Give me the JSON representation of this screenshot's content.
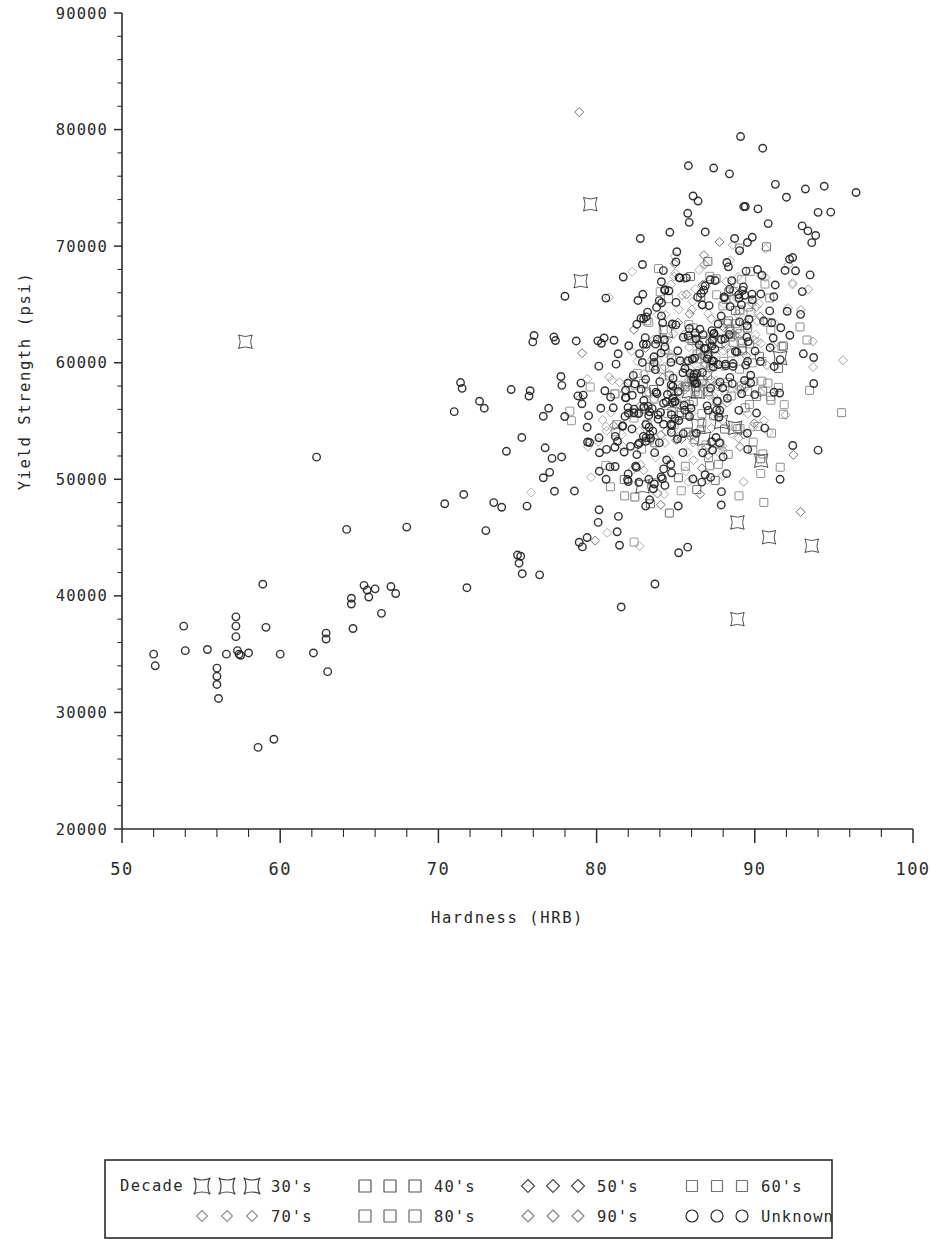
{
  "figure": {
    "width": 931,
    "height": 1239,
    "background": "#ffffff",
    "ink": "#2b2b2b"
  },
  "plot_area": {
    "left": 122,
    "right": 913,
    "top": 13,
    "bottom": 829
  },
  "chart_data": {
    "type": "scatter",
    "title": "",
    "xlabel": "Hardness (HRB)",
    "ylabel": "Yield Strength (psi)",
    "xlim": [
      50,
      100
    ],
    "ylim": [
      20000,
      90000
    ],
    "xticks": [
      50,
      60,
      70,
      80,
      90,
      100
    ],
    "xtick_labels": [
      "50",
      "60",
      "70",
      "80",
      "90",
      "100"
    ],
    "yticks": [
      20000,
      30000,
      40000,
      50000,
      60000,
      70000,
      80000,
      90000
    ],
    "ytick_labels": [
      "20000",
      "30000",
      "40000",
      "50000",
      "60000",
      "70000",
      "80000",
      "90000"
    ],
    "x_minor_step": 2,
    "y_minor_step": 2000,
    "grid": false,
    "legend_position": "below-outside",
    "legend_title": "Decade",
    "series": [
      {
        "name": "30's",
        "marker": "cushion-square",
        "size": 13,
        "color": "#3a3a3a",
        "opacity": 0.85,
        "stroke_width": 1.0,
        "count": 18,
        "cluster": {
          "x_mean": 88.0,
          "x_sd": 3.4,
          "y_mean": 52000,
          "y_sd": 8200,
          "corr": 0.25
        },
        "explicit_points": [
          [
            57.8,
            61800
          ],
          [
            79.6,
            73600
          ],
          [
            88.9,
            38000
          ],
          [
            88.9,
            46300
          ],
          [
            90.4,
            51600
          ],
          [
            93.6,
            44300
          ],
          [
            82.9,
            49400
          ],
          [
            86.4,
            57500
          ],
          [
            91.6,
            60400
          ],
          [
            84.4,
            62700
          ],
          [
            79.0,
            67000
          ]
        ]
      },
      {
        "name": "40's",
        "marker": "square",
        "size": 8,
        "color": "#4a4a4a",
        "opacity": 0.8,
        "stroke_width": 1.0,
        "count": 36,
        "cluster": {
          "x_mean": 86.2,
          "x_sd": 3.0,
          "y_mean": 57500,
          "y_sd": 5600,
          "corr": 0.35
        },
        "explicit_points": [
          [
            83.4,
            47900
          ],
          [
            84.6,
            47100
          ],
          [
            91.5,
            59500
          ]
        ]
      },
      {
        "name": "50's",
        "marker": "diamond",
        "size": 9,
        "color": "#505050",
        "opacity": 0.8,
        "stroke_width": 1.0,
        "count": 52,
        "cluster": {
          "x_mean": 85.6,
          "x_sd": 3.1,
          "y_mean": 59000,
          "y_sd": 5400,
          "corr": 0.38
        },
        "explicit_points": [
          [
            78.9,
            81500
          ],
          [
            92.9,
            47200
          ]
        ]
      },
      {
        "name": "60's",
        "marker": "square",
        "size": 8,
        "color": "#6a6a6a",
        "opacity": 0.7,
        "stroke_width": 1.0,
        "count": 58,
        "cluster": {
          "x_mean": 87.2,
          "x_sd": 3.2,
          "y_mean": 58500,
          "y_sd": 5200,
          "corr": 0.33
        },
        "explicit_points": []
      },
      {
        "name": "70's",
        "marker": "diamond",
        "size": 9,
        "color": "#7d7d7d",
        "opacity": 0.72,
        "stroke_width": 1.0,
        "count": 86,
        "cluster": {
          "x_mean": 86.8,
          "x_sd": 3.3,
          "y_mean": 58800,
          "y_sd": 5300,
          "corr": 0.36
        },
        "explicit_points": []
      },
      {
        "name": "80's",
        "marker": "square",
        "size": 8,
        "color": "#5e5e5e",
        "opacity": 0.72,
        "stroke_width": 1.0,
        "count": 78,
        "cluster": {
          "x_mean": 87.4,
          "x_sd": 3.0,
          "y_mean": 58200,
          "y_sd": 5000,
          "corr": 0.34
        },
        "explicit_points": []
      },
      {
        "name": "90's",
        "marker": "diamond",
        "size": 9,
        "color": "#8a8a8a",
        "opacity": 0.68,
        "stroke_width": 1.0,
        "count": 96,
        "cluster": {
          "x_mean": 86.0,
          "x_sd": 3.2,
          "y_mean": 58600,
          "y_sd": 5100,
          "corr": 0.37
        },
        "explicit_points": []
      },
      {
        "name": "Unknown",
        "marker": "circle",
        "size": 7.5,
        "color": "#222222",
        "opacity": 0.92,
        "stroke_width": 1.4,
        "count": 430,
        "cluster": {
          "x_mean": 85.4,
          "x_sd": 3.6,
          "y_mean": 59500,
          "y_sd": 6200,
          "corr": 0.42
        },
        "explicit_points": [
          [
            52.0,
            35000
          ],
          [
            52.1,
            34000
          ],
          [
            53.9,
            37400
          ],
          [
            54.0,
            35300
          ],
          [
            55.4,
            35400
          ],
          [
            56.0,
            33800
          ],
          [
            56.0,
            33100
          ],
          [
            56.0,
            32400
          ],
          [
            56.1,
            31200
          ],
          [
            56.6,
            35000
          ],
          [
            57.2,
            38200
          ],
          [
            57.2,
            37400
          ],
          [
            57.2,
            36500
          ],
          [
            57.3,
            35300
          ],
          [
            57.4,
            35000
          ],
          [
            57.5,
            34900
          ],
          [
            58.0,
            35100
          ],
          [
            58.6,
            27000
          ],
          [
            58.9,
            41000
          ],
          [
            59.1,
            37300
          ],
          [
            59.6,
            27700
          ],
          [
            60.0,
            35000
          ],
          [
            62.1,
            35100
          ],
          [
            62.3,
            51900
          ],
          [
            62.9,
            36800
          ],
          [
            62.9,
            36300
          ],
          [
            63.0,
            33500
          ],
          [
            64.2,
            45700
          ],
          [
            64.5,
            39800
          ],
          [
            64.5,
            39300
          ],
          [
            64.6,
            37200
          ],
          [
            65.3,
            40900
          ],
          [
            65.5,
            40500
          ],
          [
            65.6,
            39900
          ],
          [
            66.0,
            40600
          ],
          [
            66.4,
            38500
          ],
          [
            67.0,
            40800
          ],
          [
            67.3,
            40200
          ],
          [
            68.0,
            45900
          ],
          [
            70.4,
            47900
          ],
          [
            71.0,
            55800
          ],
          [
            71.4,
            58300
          ],
          [
            71.5,
            57800
          ],
          [
            71.6,
            48700
          ],
          [
            71.8,
            40700
          ],
          [
            72.6,
            56700
          ],
          [
            72.9,
            56100
          ],
          [
            73.0,
            45600
          ],
          [
            73.5,
            48000
          ],
          [
            74.0,
            47600
          ],
          [
            74.3,
            52400
          ],
          [
            74.6,
            57700
          ],
          [
            75.0,
            43500
          ],
          [
            75.1,
            42800
          ],
          [
            75.2,
            43400
          ],
          [
            75.3,
            41900
          ],
          [
            75.6,
            47700
          ],
          [
            75.8,
            57600
          ],
          [
            76.4,
            41800
          ],
          [
            77.3,
            62200
          ],
          [
            77.4,
            61900
          ],
          [
            78.0,
            65700
          ],
          [
            78.6,
            49000
          ],
          [
            78.9,
            44600
          ],
          [
            79.1,
            44200
          ],
          [
            79.4,
            45000
          ],
          [
            80.1,
            46300
          ],
          [
            80.6,
            50000
          ],
          [
            81.3,
            45500
          ],
          [
            82.0,
            49800
          ],
          [
            83.1,
            47700
          ],
          [
            83.3,
            50000
          ],
          [
            89.1,
            79400
          ],
          [
            90.5,
            78400
          ],
          [
            85.8,
            76900
          ],
          [
            87.4,
            76700
          ],
          [
            88.4,
            76200
          ],
          [
            91.3,
            75300
          ],
          [
            92.0,
            74200
          ],
          [
            93.2,
            74900
          ],
          [
            96.4,
            74600
          ],
          [
            94.0,
            72900
          ],
          [
            93.6,
            70300
          ],
          [
            93.0,
            66100
          ],
          [
            92.4,
            52900
          ],
          [
            91.6,
            50000
          ],
          [
            94.0,
            52500
          ],
          [
            86.1,
            74300
          ],
          [
            89.4,
            73400
          ],
          [
            90.2,
            73200
          ]
        ]
      }
    ]
  },
  "legend": {
    "title": "Decade",
    "box": {
      "x": 105,
      "y": 1160,
      "width": 727,
      "height": 78
    },
    "rows": [
      [
        {
          "label": "30's",
          "marker": "cushion-square",
          "size": 15,
          "color": "#3a3a3a"
        },
        {
          "label": "40's",
          "marker": "square",
          "size": 12,
          "color": "#4a4a4a"
        },
        {
          "label": "50's",
          "marker": "diamond",
          "size": 13,
          "color": "#3f3f3f"
        },
        {
          "label": "60's",
          "marker": "square",
          "size": 11,
          "color": "#6a6a6a"
        }
      ],
      [
        {
          "label": "70's",
          "marker": "diamond",
          "size": 11,
          "color": "#8a8a8a"
        },
        {
          "label": "80's",
          "marker": "square",
          "size": 12,
          "color": "#5e5e5e"
        },
        {
          "label": "90's",
          "marker": "diamond",
          "size": 12,
          "color": "#7a7a7a"
        },
        {
          "label": "Unknown",
          "marker": "circle",
          "size": 12,
          "color": "#1d1d1d"
        }
      ]
    ]
  }
}
